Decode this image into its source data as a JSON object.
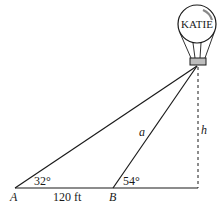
{
  "diagram": {
    "type": "trigonometry-word-problem",
    "balloon": {
      "label": "KATIE"
    },
    "points": {
      "A": "A",
      "B": "B"
    },
    "angles": {
      "at_A": "32°",
      "at_B": "54°"
    },
    "segments": {
      "AB_length": "120 ft",
      "side_a": "a",
      "height": "h"
    },
    "colors": {
      "line": "#1a1a1a",
      "basket": "#bdbdbd"
    }
  }
}
